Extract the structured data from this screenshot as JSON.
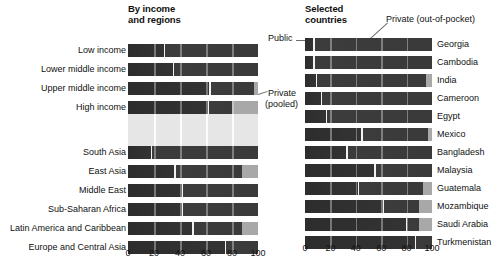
{
  "panels": {
    "left": {
      "title": "By income\nand regions",
      "title_line1": "By income",
      "title_line2": "and regions"
    },
    "right": {
      "title_line1": "Selected",
      "title_line2": "countries"
    }
  },
  "annotations": {
    "public": "Public",
    "private_pooled_line1": "Private",
    "private_pooled_line2": "(pooled)",
    "private_oop": "Private (out-of-pocket)"
  },
  "axis": {
    "ticks": [
      0,
      20,
      40,
      60,
      80,
      100
    ],
    "min": 0,
    "max": 100
  },
  "colors": {
    "public": "#2d2d2d",
    "private_oop": "#3a3a3a",
    "private_pooled": "#a8a8a8",
    "track": "#e6e6e6",
    "text": "#111111"
  },
  "chart_data": [
    {
      "type": "bar",
      "orientation": "horizontal",
      "stacked": true,
      "title": "By income and regions",
      "xlabel": "",
      "ylabel": "",
      "xlim": [
        0,
        100
      ],
      "grid": true,
      "legend": [
        "Public",
        "Private (out-of-pocket)",
        "Private (pooled)"
      ],
      "legend_position": "annotated",
      "categories": [
        "Low income",
        "Lower middle income",
        "Upper middle income",
        "High income",
        "South Asia",
        "East Asia",
        "Middle East",
        "Sub-Saharan Africa",
        "Latin America and Caribbean",
        "Europe and Central Asia"
      ],
      "series": [
        {
          "name": "Public",
          "values": [
            28,
            35,
            63,
            62,
            18,
            36,
            42,
            42,
            50,
            75
          ]
        },
        {
          "name": "Private (out-of-pocket)",
          "values": [
            72,
            65,
            34,
            18,
            82,
            52,
            58,
            58,
            38,
            25
          ]
        },
        {
          "name": "Private (pooled)",
          "values": [
            0,
            0,
            3,
            20,
            0,
            12,
            0,
            0,
            12,
            0
          ]
        }
      ]
    },
    {
      "type": "bar",
      "orientation": "horizontal",
      "stacked": true,
      "title": "Selected countries",
      "xlabel": "",
      "ylabel": "",
      "xlim": [
        0,
        100
      ],
      "grid": true,
      "legend": [
        "Public",
        "Private (out-of-pocket)",
        "Private (pooled)"
      ],
      "legend_position": "annotated",
      "categories": [
        "Georgia",
        "Cambodia",
        "India",
        "Cameroon",
        "Egypt",
        "Mexico",
        "Bangladesh",
        "Malaysia",
        "Guatemala",
        "Mozambique",
        "Saudi Arabia",
        "Turkmenistan"
      ],
      "series": [
        {
          "name": "Public",
          "values": [
            7,
            7,
            9,
            13,
            17,
            45,
            33,
            55,
            42,
            62,
            80,
            87
          ]
        },
        {
          "name": "Private (out-of-pocket)",
          "values": [
            93,
            93,
            86,
            87,
            83,
            52,
            67,
            45,
            51,
            28,
            10,
            13
          ]
        },
        {
          "name": "Private (pooled)",
          "values": [
            0,
            0,
            5,
            0,
            0,
            3,
            0,
            0,
            7,
            10,
            10,
            0
          ]
        }
      ]
    }
  ]
}
